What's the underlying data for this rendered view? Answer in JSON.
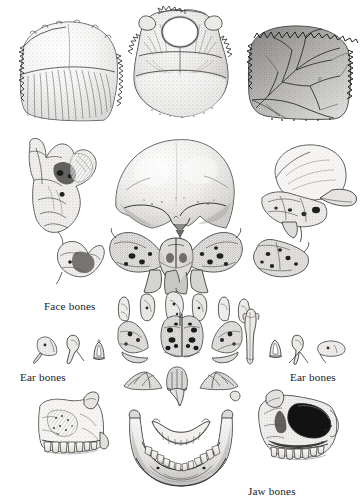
{
  "plate": {
    "title": "Disarticulated human skull bones",
    "background_color": "#ffffff",
    "ink_color": "#2b2b2b",
    "width": 362,
    "height": 504,
    "medium": "stippled engraving / line illustration"
  },
  "labels": [
    {
      "id": "face-bones",
      "text": "Face bones",
      "x": 44,
      "y": 300,
      "align": "left"
    },
    {
      "id": "ear-bones-left",
      "text": "Ear bones",
      "x": 20,
      "y": 371,
      "align": "left"
    },
    {
      "id": "ear-bones-right",
      "text": "Ear bones",
      "x": 290,
      "y": 371,
      "align": "left"
    },
    {
      "id": "jaw-bones",
      "text": "Jaw bones",
      "x": 248,
      "y": 485,
      "align": "left"
    }
  ],
  "figures": [
    {
      "id": "frontal-bone-inner",
      "name": "frontal-bone",
      "row": 1,
      "column": "left",
      "x": 12,
      "y": 24,
      "width": 108,
      "height": 97,
      "shading": "stippled with radiating fibrous striations across lower half",
      "edge": "serrated sutural margin on left and right borders"
    },
    {
      "id": "occipital-bone",
      "name": "occipital-bone",
      "row": 1,
      "column": "center",
      "x": 122,
      "y": 6,
      "width": 105,
      "height": 113,
      "feature": "foramen magnum aperture near top centre",
      "shading": "dense stipple, darker toward lower right",
      "edge": "serrated sutural margin around crown"
    },
    {
      "id": "parietal-bone-inner",
      "name": "parietal-bone",
      "row": 1,
      "column": "right",
      "x": 244,
      "y": 26,
      "width": 108,
      "height": 94,
      "feature": "branching middle meningeal vascular grooves",
      "shading": "dark stipple upper-left to mid, lighter lower-right",
      "edge": "heavily serrated sutural margin on top and right"
    },
    {
      "id": "ethmoid-bone",
      "name": "ethmoid-bone",
      "row": 2,
      "column": "left",
      "x": 18,
      "y": 138,
      "width": 82,
      "height": 94,
      "shading": "fine stipple with deep hatched recesses"
    },
    {
      "id": "frontal-bone-outer",
      "name": "frontal-bone-outer-view",
      "row": 2,
      "column": "center",
      "x": 112,
      "y": 133,
      "width": 122,
      "height": 95,
      "feature": "supraorbital margins and nasal notch at base",
      "shading": "smooth graded stipple, dome highlight upper centre"
    },
    {
      "id": "temporal-bone-right",
      "name": "temporal-bone",
      "row": 2,
      "column": "right",
      "x": 257,
      "y": 145,
      "width": 94,
      "height": 80,
      "feature": "zygomatic process and mastoid region",
      "shading": "soft stipple with dark foramina"
    },
    {
      "id": "temporal-bone-small-left",
      "name": "temporal-bone-petrous-left",
      "row": 3,
      "column": "left",
      "x": 56,
      "y": 238,
      "width": 52,
      "height": 45,
      "shading": "stipple with dark concavity"
    },
    {
      "id": "sphenoid-bone",
      "name": "sphenoid-bone",
      "row": 3,
      "column": "center",
      "x": 110,
      "y": 228,
      "width": 132,
      "height": 68,
      "feature": "greater wings spread like a butterfly, pterygoid plates below",
      "shading": "dark stipple with deep shadowed fossae"
    },
    {
      "id": "temporal-bone-small-right",
      "name": "temporal-bone-petrous-right",
      "row": 3,
      "column": "right",
      "x": 253,
      "y": 238,
      "width": 56,
      "height": 44,
      "shading": "stipple with pitted surface"
    },
    {
      "id": "face-bone-nasal-left",
      "name": "nasal-bone",
      "row": 4,
      "column": "inner-left",
      "x": 118,
      "y": 296,
      "width": 16,
      "height": 26
    },
    {
      "id": "face-bone-lacrimal",
      "name": "lacrimal-bone",
      "row": 4,
      "column": "inner-left",
      "x": 140,
      "y": 292,
      "width": 18,
      "height": 30
    },
    {
      "id": "face-bone-zygomatic",
      "name": "zygomatic-bone",
      "row": 4,
      "column": "inner-center",
      "x": 166,
      "y": 290,
      "width": 20,
      "height": 32
    },
    {
      "id": "face-bone-palatine",
      "name": "palatine-bone",
      "row": 4,
      "column": "inner-right",
      "x": 192,
      "y": 292,
      "width": 18,
      "height": 30
    },
    {
      "id": "face-bone-nasal-right",
      "name": "nasal-bone-right",
      "row": 4,
      "column": "inner-right",
      "x": 218,
      "y": 296,
      "width": 14,
      "height": 26
    },
    {
      "id": "face-bone-vomer-small",
      "name": "vomer-small",
      "row": 4,
      "column": "far-right",
      "x": 238,
      "y": 300,
      "width": 14,
      "height": 22
    },
    {
      "id": "inferior-concha-left",
      "name": "inferior-nasal-concha-left",
      "row": 5,
      "column": "center-left",
      "x": 118,
      "y": 318,
      "width": 36,
      "height": 42
    },
    {
      "id": "ethmoid-labyrinth",
      "name": "ethmoid-labyrinth",
      "row": 5,
      "column": "center",
      "x": 160,
      "y": 314,
      "width": 44,
      "height": 48,
      "feature": "paired air cells, dark perforations"
    },
    {
      "id": "inferior-concha-right",
      "name": "inferior-nasal-concha-right",
      "row": 5,
      "column": "center-right",
      "x": 208,
      "y": 316,
      "width": 34,
      "height": 44
    },
    {
      "id": "vomer-bone",
      "name": "vomer-bone",
      "row": 5,
      "column": "right",
      "x": 246,
      "y": 310,
      "width": 12,
      "height": 52
    },
    {
      "id": "ear-ossicle-malleus-left",
      "name": "malleus-bone",
      "row": 5,
      "column": "far-left",
      "x": 34,
      "y": 337,
      "width": 26,
      "height": 26
    },
    {
      "id": "ear-ossicle-incus-left",
      "name": "incus-bone",
      "row": 5,
      "column": "far-left",
      "x": 66,
      "y": 335,
      "width": 20,
      "height": 28
    },
    {
      "id": "ear-ossicle-stapes-left",
      "name": "stapes-bone",
      "row": 5,
      "column": "far-left",
      "x": 92,
      "y": 341,
      "width": 14,
      "height": 18
    },
    {
      "id": "ear-ossicle-stapes-right",
      "name": "stapes-bone-right",
      "row": 5,
      "column": "far-right",
      "x": 268,
      "y": 340,
      "width": 16,
      "height": 18
    },
    {
      "id": "ear-ossicle-incus-right",
      "name": "incus-bone-right",
      "row": 5,
      "column": "far-right",
      "x": 290,
      "y": 334,
      "width": 20,
      "height": 30
    },
    {
      "id": "ear-ossicle-malleus-right",
      "name": "malleus-bone-right",
      "row": 5,
      "column": "far-right",
      "x": 316,
      "y": 336,
      "width": 30,
      "height": 24
    },
    {
      "id": "palatine-pair-left",
      "name": "palatine-bone-pair-left",
      "row": 6,
      "column": "center-left",
      "x": 124,
      "y": 370,
      "width": 40,
      "height": 22
    },
    {
      "id": "vomer-base",
      "name": "vomer-base",
      "row": 6,
      "column": "center",
      "x": 168,
      "y": 368,
      "width": 26,
      "height": 26
    },
    {
      "id": "palatine-pair-right",
      "name": "palatine-bone-pair-right",
      "row": 6,
      "column": "center-right",
      "x": 198,
      "y": 370,
      "width": 42,
      "height": 22
    },
    {
      "id": "maxilla-left",
      "name": "maxilla-bone-left",
      "row": 7,
      "column": "left",
      "x": 34,
      "y": 397,
      "width": 84,
      "height": 76,
      "feature": "alveolar arch with full row of teeth along lower border",
      "shading": "stipple with dark maxillary sinus recess"
    },
    {
      "id": "mandible",
      "name": "mandible-bone",
      "row": 7,
      "column": "center",
      "x": 126,
      "y": 414,
      "width": 110,
      "height": 82,
      "feature": "U-shaped body, coronoid and condylar processes, lower tooth row; upper dental arch fragment above",
      "shading": "graded stipple, darkest along lower border"
    },
    {
      "id": "upper-dental-arch",
      "name": "upper-dental-arch",
      "row": 7,
      "column": "center",
      "x": 152,
      "y": 420,
      "width": 58,
      "height": 26
    },
    {
      "id": "maxilla-right",
      "name": "maxilla-bone-right",
      "row": 7,
      "column": "right",
      "x": 255,
      "y": 395,
      "width": 82,
      "height": 80,
      "feature": "orbital cavity shown dark, alveolar arch with teeth",
      "shading": "heavy stipple with deep black orbital socket"
    },
    {
      "id": "nasal-bone-upper-center",
      "name": "nasal-bone-upper",
      "row": 6,
      "column": "center",
      "x": 166,
      "y": 388,
      "width": 24,
      "height": 20
    }
  ]
}
